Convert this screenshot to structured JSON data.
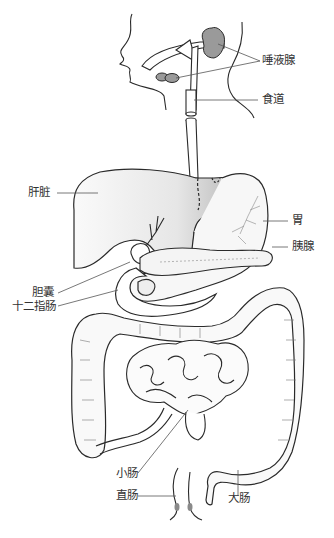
{
  "labels": {
    "salivary_glands": "唾液腺",
    "esophagus": "食道",
    "liver": "肝脏",
    "stomach": "胃",
    "pancreas": "胰腺",
    "gallbladder": "胆囊",
    "duodenum": "十二指肠",
    "small_intestine": "小肠",
    "rectum": "直肠",
    "large_intestine": "大肠"
  },
  "colors": {
    "outline": "#2a2a2a",
    "label_text": "#333333",
    "leader_line": "#555555",
    "gland_fill": "#9a9a9a",
    "liver_fill": "#f4f4f4",
    "liver_left_lobe_fill": "#b5b5b5",
    "organ_fill": "#f7f7f7"
  }
}
